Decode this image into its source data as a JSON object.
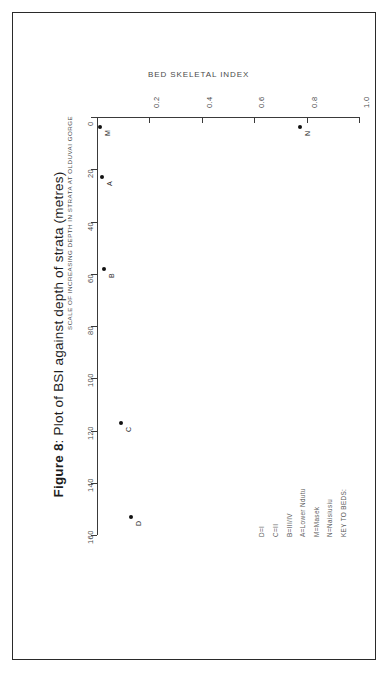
{
  "figure": {
    "caption_prefix": "Figure 8",
    "caption_text": ": Plot of BSI against depth of strata (metres)"
  },
  "chart_data": {
    "type": "scatter",
    "title": "BED SKELETAL INDEX",
    "xlabel": "BED SKELETAL INDEX",
    "ylabel": "SCALE OF INCREASING DEPTH IN STRATA AT OLDUVAI GORGE",
    "orientation": "rotated-90-ccw",
    "grid": false,
    "xlim": [
      0.0,
      1.0
    ],
    "ylim": [
      0,
      160
    ],
    "y_axis_inverted": true,
    "xticks": [
      "0.2",
      "0.4",
      "0.6",
      "0.8",
      "1.0"
    ],
    "xtick_values": [
      0.2,
      0.4,
      0.6,
      0.8,
      1.0
    ],
    "yticks": [
      "0",
      "20",
      "40",
      "60",
      "80",
      "100",
      "120",
      "140",
      "160"
    ],
    "ytick_values": [
      0,
      20,
      40,
      60,
      80,
      100,
      120,
      140,
      160
    ],
    "origin_label": "0",
    "points": [
      {
        "label": "M",
        "x": 0.012,
        "y": 4
      },
      {
        "label": "N",
        "x": 0.775,
        "y": 4
      },
      {
        "label": "A",
        "x": 0.018,
        "y": 23
      },
      {
        "label": "B",
        "x": 0.025,
        "y": 58
      },
      {
        "label": "C",
        "x": 0.092,
        "y": 117
      },
      {
        "label": "D",
        "x": 0.13,
        "y": 153
      }
    ]
  },
  "key": {
    "title": "KEY TO BEDS:",
    "entries": [
      "N=Naisiusiu",
      "M=Masek",
      "A=Lower Ndutu",
      "B=III/IV",
      "C=II",
      "D=I"
    ]
  },
  "colors": {
    "ink": "#222222",
    "axis": "#3a3a3a",
    "muted": "#4a4a4a",
    "point": "#111111",
    "border": "#2a2a2a"
  }
}
